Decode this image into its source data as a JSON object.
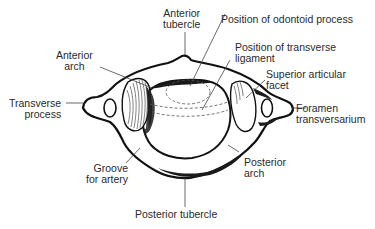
{
  "diagram": {
    "colors": {
      "background": "#ffffff",
      "bone_outline": "#111111",
      "shading": "#1a1a1a",
      "leader_line": "#444444",
      "label_text": "#2a2a2a"
    },
    "labels": {
      "anterior_tubercle": {
        "line1": "Anterior",
        "line2": "tubercle"
      },
      "position_odontoid": {
        "line1": "Position of odontoid process"
      },
      "anterior_arch": {
        "line1": "Anterior",
        "line2": "arch"
      },
      "position_transverse_ligament": {
        "line1": "Position of transverse",
        "line2": "ligament"
      },
      "superior_articular_facet": {
        "line1": "Superior articular",
        "line2": "facet"
      },
      "transverse_process": {
        "line1": "Transverse",
        "line2": "process"
      },
      "foramen_transversarium": {
        "line1": "Foramen",
        "line2": "transversarium"
      },
      "groove_for_artery": {
        "line1": "Groove",
        "line2": "for artery"
      },
      "posterior_arch": {
        "line1": "Posterior",
        "line2": "arch"
      },
      "posterior_tubercle": {
        "line1": "Posterior tubercle"
      }
    }
  }
}
